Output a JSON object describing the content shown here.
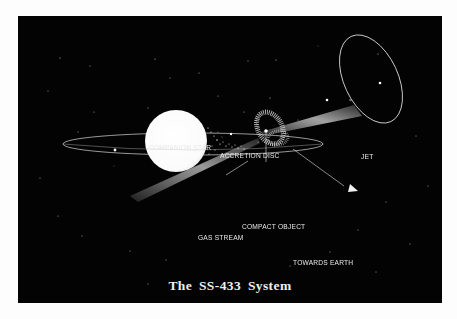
{
  "diagram": {
    "title": "The SS-433 System",
    "background_color": "#030303",
    "page_color": "#fdfdfd",
    "labels": {
      "companion_star": "COMPANION STAR",
      "accretion_disc": "ACCRETION DISC",
      "jet": "JET",
      "compact_object": "COMPACT OBJECT",
      "gas_stream": "GAS STREAM",
      "towards_earth": "TOWARDS EARTH"
    },
    "elements": [
      {
        "name": "companion-star",
        "shape": "circle",
        "color": "#ffffff"
      },
      {
        "name": "orbit",
        "shape": "ellipse"
      },
      {
        "name": "accretion-disc",
        "shape": "speckled ring"
      },
      {
        "name": "jet",
        "shape": "cone beam"
      },
      {
        "name": "precession-ellipse",
        "shape": "ellipse"
      },
      {
        "name": "towards-earth-arrow",
        "shape": "arrow"
      }
    ]
  }
}
